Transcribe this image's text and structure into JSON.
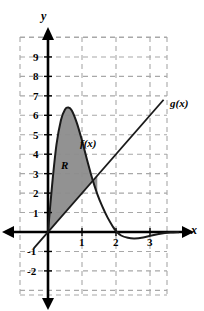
{
  "figure": {
    "kind": "cartesian-graph",
    "background_color": "#ffffff",
    "axis_color": "#000000",
    "grid_color": "#a8a8a8",
    "shade_color": "#8c8c8c",
    "curve_color": "#1a1a1a"
  },
  "axes": {
    "x_letter": "x",
    "y_letter": "y",
    "x_tick_labels": [
      "1",
      "2",
      "3"
    ],
    "x_tick_values": [
      1,
      2,
      3
    ],
    "y_tick_labels": [
      "9",
      "8",
      "7",
      "6",
      "5",
      "4",
      "3",
      "2",
      "1",
      "-1",
      "-2"
    ],
    "y_tick_values": [
      9,
      8,
      7,
      6,
      5,
      4,
      3,
      2,
      1,
      -1,
      -2
    ],
    "xlim": [
      -1.4,
      3.9
    ],
    "ylim": [
      -3.1,
      10.4
    ],
    "grid": "dashed"
  },
  "chart_data": {
    "type": "line",
    "title": "",
    "xlabel": "x",
    "ylabel": "y",
    "xlim": [
      -1.4,
      3.9
    ],
    "ylim": [
      -3.1,
      10.4
    ],
    "grid": true,
    "legend": "inline-curve-labels",
    "series": [
      {
        "name": "f(x)",
        "label": "f(x)",
        "label_position": {
          "x": 1.0,
          "y": 4.4
        },
        "points": [
          {
            "x": 0.0,
            "y": 0.0
          },
          {
            "x": 0.12,
            "y": 2.4
          },
          {
            "x": 0.25,
            "y": 4.5
          },
          {
            "x": 0.38,
            "y": 5.75
          },
          {
            "x": 0.5,
            "y": 6.3
          },
          {
            "x": 0.6,
            "y": 6.4
          },
          {
            "x": 0.7,
            "y": 6.25
          },
          {
            "x": 0.85,
            "y": 5.6
          },
          {
            "x": 1.0,
            "y": 4.7
          },
          {
            "x": 1.15,
            "y": 3.7
          },
          {
            "x": 1.3,
            "y": 2.75
          },
          {
            "x": 1.45,
            "y": 1.95
          },
          {
            "x": 1.6,
            "y": 1.3
          },
          {
            "x": 1.75,
            "y": 0.75
          },
          {
            "x": 1.9,
            "y": 0.3
          },
          {
            "x": 2.0,
            "y": 0.05
          },
          {
            "x": 2.15,
            "y": -0.18
          },
          {
            "x": 2.35,
            "y": -0.3
          },
          {
            "x": 2.55,
            "y": -0.33
          },
          {
            "x": 2.8,
            "y": -0.28
          },
          {
            "x": 3.05,
            "y": -0.18
          },
          {
            "x": 3.3,
            "y": -0.09
          },
          {
            "x": 3.6,
            "y": -0.03
          },
          {
            "x": 3.85,
            "y": -0.01
          }
        ]
      },
      {
        "name": "g(x)",
        "label": "g(x)",
        "label_position": {
          "x": 3.45,
          "y": 6.6
        },
        "slope": 2.0,
        "intercept": 0.0,
        "points": [
          {
            "x": -0.42,
            "y": -0.84
          },
          {
            "x": 3.4,
            "y": 6.8
          }
        ]
      }
    ],
    "shaded_region": {
      "name": "R",
      "label": "R",
      "label_position": {
        "x": 0.42,
        "y": 3.35
      },
      "upper_curve": "f(x)",
      "lower_curve": "g(x)",
      "x_from": 0.0,
      "x_to": 1.45
    }
  }
}
